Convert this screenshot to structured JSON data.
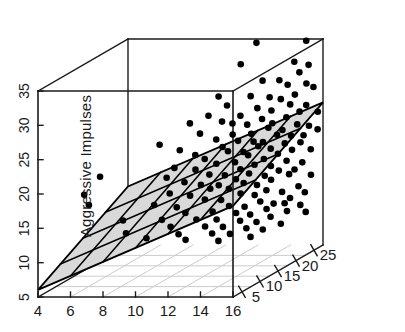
{
  "chart_data": {
    "type": "scatter",
    "subtype": "scatter3d-with-regression-plane",
    "title": "",
    "xlabel": "",
    "ylabel": "",
    "zlabel": "Aggressive Impulses",
    "xlim": [
      4,
      16
    ],
    "ylim": [
      2.5,
      27.5
    ],
    "zlim": [
      5,
      35
    ],
    "xticks": [
      4,
      6,
      8,
      10,
      12,
      14,
      16
    ],
    "yticks": [
      5,
      10,
      15,
      20,
      25
    ],
    "zticks": [
      5,
      10,
      15,
      20,
      25,
      30,
      35
    ],
    "xticklabels": [
      "4",
      "6",
      "8",
      "10",
      "12",
      "14",
      "16"
    ],
    "yticklabels": [
      "5",
      "10",
      "15",
      "20",
      "25"
    ],
    "zticklabels": [
      "5",
      "10",
      "15",
      "20",
      "25",
      "30",
      "35"
    ],
    "grid": true,
    "legend": null,
    "marker": {
      "shape": "circle",
      "color": "#000000",
      "size": 6.6
    },
    "plane": {
      "fill": "#d9d9d9",
      "edge": "#000000",
      "grid_cells_x": 6,
      "grid_cells_y": 4,
      "description": "fitted regression plane rising with x and y"
    },
    "points": [
      [
        12.9,
        23.0,
        35.8
      ],
      [
        12.6,
        20.0,
        33.6
      ],
      [
        15.3,
        26.0,
        35.2
      ],
      [
        14.9,
        24.5,
        32.6
      ],
      [
        15.6,
        25.3,
        31.9
      ],
      [
        13.5,
        22.0,
        30.6
      ],
      [
        11.9,
        17.0,
        29.8
      ],
      [
        14.2,
        23.5,
        30.2
      ],
      [
        15.1,
        25.0,
        30.9
      ],
      [
        12.2,
        18.0,
        28.2
      ],
      [
        13.1,
        20.5,
        28.8
      ],
      [
        14.6,
        24.0,
        29.4
      ],
      [
        15.4,
        25.6,
        29.1
      ],
      [
        10.8,
        14.0,
        26.8
      ],
      [
        11.5,
        16.0,
        27.3
      ],
      [
        13.8,
        22.6,
        28.0
      ],
      [
        14.4,
        23.0,
        27.6
      ],
      [
        15.0,
        24.2,
        27.9
      ],
      [
        15.7,
        26.2,
        28.4
      ],
      [
        12.0,
        17.5,
        26.0
      ],
      [
        12.8,
        19.0,
        26.4
      ],
      [
        13.4,
        21.0,
        26.9
      ],
      [
        14.0,
        22.2,
        26.2
      ],
      [
        14.8,
        23.8,
        26.6
      ],
      [
        15.5,
        25.1,
        26.1
      ],
      [
        9.6,
        11.0,
        24.6
      ],
      [
        11.2,
        15.0,
        25.0
      ],
      [
        12.4,
        18.6,
        25.4
      ],
      [
        13.0,
        20.0,
        24.8
      ],
      [
        13.6,
        21.4,
        25.2
      ],
      [
        14.1,
        22.0,
        24.4
      ],
      [
        14.7,
        23.2,
        24.9
      ],
      [
        15.2,
        24.6,
        25.3
      ],
      [
        15.9,
        26.5,
        24.7
      ],
      [
        10.4,
        13.0,
        23.2
      ],
      [
        11.8,
        16.8,
        23.6
      ],
      [
        12.5,
        18.2,
        23.9
      ],
      [
        13.2,
        20.2,
        23.4
      ],
      [
        13.9,
        21.8,
        23.8
      ],
      [
        14.5,
        23.0,
        23.1
      ],
      [
        15.1,
        24.4,
        23.5
      ],
      [
        15.6,
        25.4,
        23.0
      ],
      [
        11.0,
        14.6,
        22.0
      ],
      [
        12.1,
        17.2,
        22.4
      ],
      [
        12.7,
        18.8,
        22.8
      ],
      [
        13.3,
        20.4,
        22.2
      ],
      [
        13.7,
        21.2,
        21.9
      ],
      [
        14.3,
        22.4,
        22.6
      ],
      [
        14.9,
        23.6,
        22.1
      ],
      [
        15.4,
        24.8,
        21.8
      ],
      [
        16.0,
        26.0,
        22.3
      ],
      [
        10.2,
        12.4,
        20.8
      ],
      [
        11.4,
        15.4,
        21.2
      ],
      [
        12.3,
        17.8,
        21.6
      ],
      [
        12.9,
        19.4,
        21.0
      ],
      [
        13.5,
        20.8,
        21.4
      ],
      [
        14.0,
        22.0,
        20.7
      ],
      [
        14.6,
        23.2,
        21.1
      ],
      [
        15.3,
        24.4,
        20.9
      ],
      [
        9.9,
        11.6,
        19.6
      ],
      [
        11.1,
        14.2,
        20.0
      ],
      [
        11.9,
        16.4,
        20.2
      ],
      [
        12.6,
        18.4,
        19.8
      ],
      [
        13.1,
        19.8,
        20.4
      ],
      [
        13.8,
        21.0,
        19.5
      ],
      [
        14.4,
        22.2,
        19.9
      ],
      [
        15.0,
        23.4,
        20.1
      ],
      [
        15.8,
        25.0,
        19.7
      ],
      [
        10.6,
        13.4,
        18.4
      ],
      [
        11.6,
        15.8,
        18.8
      ],
      [
        12.2,
        17.4,
        18.2
      ],
      [
        12.8,
        19.0,
        18.6
      ],
      [
        13.4,
        20.2,
        18.9
      ],
      [
        14.1,
        21.6,
        18.3
      ],
      [
        14.8,
        22.8,
        18.7
      ],
      [
        15.5,
        24.0,
        18.1
      ],
      [
        10.0,
        12.0,
        17.2
      ],
      [
        11.3,
        14.8,
        17.6
      ],
      [
        12.0,
        16.6,
        17.0
      ],
      [
        12.7,
        18.2,
        17.4
      ],
      [
        13.2,
        19.6,
        17.8
      ],
      [
        13.9,
        20.8,
        17.1
      ],
      [
        14.5,
        22.0,
        17.5
      ],
      [
        15.2,
        23.2,
        17.3
      ],
      [
        9.4,
        10.4,
        16.0
      ],
      [
        10.9,
        13.6,
        16.4
      ],
      [
        11.7,
        15.6,
        16.8
      ],
      [
        12.4,
        17.6,
        16.2
      ],
      [
        13.0,
        19.0,
        16.6
      ],
      [
        13.6,
        20.0,
        16.0
      ],
      [
        14.2,
        21.2,
        16.4
      ],
      [
        15.0,
        22.6,
        16.8
      ],
      [
        15.9,
        24.6,
        16.1
      ],
      [
        10.3,
        12.6,
        15.0
      ],
      [
        11.5,
        15.0,
        15.4
      ],
      [
        12.1,
        16.8,
        14.8
      ],
      [
        12.9,
        18.6,
        15.2
      ],
      [
        13.5,
        19.8,
        14.6
      ],
      [
        14.0,
        20.8,
        15.0
      ],
      [
        14.7,
        22.0,
        14.4
      ],
      [
        15.4,
        23.4,
        14.8
      ],
      [
        9.7,
        11.2,
        13.6
      ],
      [
        10.7,
        13.2,
        14.0
      ],
      [
        11.8,
        15.8,
        13.4
      ],
      [
        12.5,
        17.2,
        13.8
      ],
      [
        13.1,
        18.8,
        13.2
      ],
      [
        13.8,
        20.0,
        13.6
      ],
      [
        14.4,
        21.0,
        13.0
      ],
      [
        15.1,
        22.4,
        13.4
      ],
      [
        15.7,
        23.8,
        13.8
      ],
      [
        8.2,
        8.0,
        12.6
      ],
      [
        10.1,
        11.8,
        12.4
      ],
      [
        11.2,
        14.0,
        12.8
      ],
      [
        12.0,
        16.0,
        12.2
      ],
      [
        12.8,
        17.8,
        12.6
      ],
      [
        13.4,
        19.0,
        12.0
      ],
      [
        14.1,
        20.4,
        12.4
      ],
      [
        14.9,
        21.8,
        12.8
      ],
      [
        15.6,
        23.0,
        12.2
      ],
      [
        9.1,
        9.6,
        11.4
      ],
      [
        10.5,
        12.2,
        11.2
      ],
      [
        11.6,
        14.6,
        11.6
      ],
      [
        12.3,
        16.4,
        11.0
      ],
      [
        13.0,
        18.0,
        11.4
      ],
      [
        13.7,
        19.4,
        10.8
      ],
      [
        14.3,
        20.6,
        11.2
      ],
      [
        15.0,
        22.0,
        11.6
      ],
      [
        15.8,
        23.6,
        11.0
      ],
      [
        10.8,
        12.8,
        10.2
      ],
      [
        11.9,
        15.2,
        10.4
      ],
      [
        12.6,
        17.0,
        9.8
      ],
      [
        13.3,
        18.4,
        10.2
      ],
      [
        14.0,
        19.8,
        9.6
      ],
      [
        14.8,
        21.2,
        10.0
      ],
      [
        12.2,
        15.6,
        9.2
      ],
      [
        13.6,
        18.2,
        9.0
      ],
      [
        6.2,
        5.4,
        19.0
      ],
      [
        6.4,
        5.8,
        17.4
      ],
      [
        8.1,
        7.6,
        14.6
      ],
      [
        7.0,
        6.2,
        21.4
      ]
    ]
  },
  "axes": {
    "x_axis_name": "x-axis-bottom",
    "y_axis_name": "depth-axis",
    "z_axis_name": "z-axis-left",
    "z_title": "Aggressive Impulses"
  },
  "colors": {
    "background": "#ffffff",
    "box_line": "#1a1a1a",
    "floor_grid": "#cccccc",
    "plane_fill": "#d9d9d9",
    "plane_line": "#000000",
    "point": "#000000",
    "tick_text": "#1a1a1a"
  }
}
